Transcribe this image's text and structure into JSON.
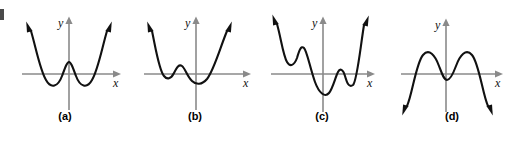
{
  "figure": {
    "title": "",
    "background_color": "#ffffff",
    "curve_color": "#111111",
    "axis_color": "#8a8a8a",
    "label_color": "#000000",
    "panel_count": 4
  },
  "axis_labels": {
    "x": "x",
    "y": "y"
  },
  "panels": [
    {
      "id": "a",
      "label": "(a)",
      "description": "Quartic with positive leading coefficient; W shape with two minima below the x-axis and a local maximum above the x-axis on the y-axis; both ends rise.",
      "end_behavior_left": "up",
      "end_behavior_right": "up",
      "turning_points": 3,
      "x_intercepts": 4
    },
    {
      "id": "b",
      "label": "(b)",
      "description": "Quartic with positive leading coefficient; shallow left minimum touching below the axis, small local maximum above the axis, then main minimum below the axis near the y-axis; both ends rise.",
      "end_behavior_left": "up",
      "end_behavior_right": "up",
      "turning_points": 3,
      "x_intercepts": 4
    },
    {
      "id": "c",
      "label": "(c)",
      "description": "Degree six curve with positive leading coefficient; left local minimum and maximum above and across the axis, deep central minimum below the axis, small right bump crossing the axis, then rising; both ends rise.",
      "end_behavior_left": "up",
      "end_behavior_right": "up",
      "turning_points": 5,
      "x_intercepts": 4
    },
    {
      "id": "d",
      "label": "(d)",
      "description": "Quartic with negative leading coefficient; two maxima above the x-axis with a central minimum below the x-axis; both ends fall.",
      "end_behavior_left": "down",
      "end_behavior_right": "down",
      "turning_points": 3,
      "x_intercepts": 4
    }
  ]
}
